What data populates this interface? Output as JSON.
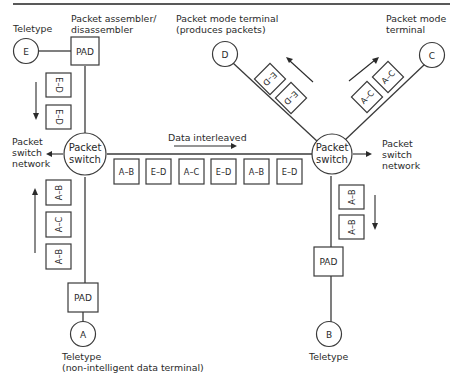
{
  "diagram": {
    "colors": {
      "line": "#3a3a3a",
      "text": "#2a2a2a",
      "background": "#ffffff"
    },
    "labels": {
      "teletype_e": "Teletype",
      "pad_top_line1": "Packet assembler/",
      "pad_top_line2": "disassembler",
      "terminal_d_line1": "Packet mode terminal",
      "terminal_d_line2": "(produces packets)",
      "terminal_c_line1": "Packet mode",
      "terminal_c_line2": "terminal",
      "network_left_line1": "Packet",
      "network_left_line2": "switch",
      "network_left_line3": "network",
      "network_right_line1": "Packet",
      "network_right_line2": "switch",
      "network_right_line3": "network",
      "data_interleaved": "Data interleaved",
      "teletype_a_line1": "Teletype",
      "teletype_a_line2": "(non-intelligent data terminal)",
      "teletype_b": "Teletype"
    },
    "nodes": {
      "terminal_e": "E",
      "terminal_d": "D",
      "terminal_c": "C",
      "terminal_a": "A",
      "terminal_b": "B",
      "pad_top": "PAD",
      "pad_left_bottom": "PAD",
      "pad_right_bottom": "PAD",
      "switch_left_line1": "Packet",
      "switch_left_line2": "switch",
      "switch_right_line1": "Packet",
      "switch_right_line2": "switch"
    },
    "packets": {
      "e_to_switch": [
        "E–D",
        "E–D"
      ],
      "a_to_switch": [
        "A–B",
        "A–C",
        "A–B"
      ],
      "interleaved": [
        "A–B",
        "E–D",
        "A–C",
        "E–D",
        "A–B",
        "E–D"
      ],
      "switch_to_d": [
        "E–D",
        "E–D"
      ],
      "switch_to_c": [
        "A–C",
        "A–C"
      ],
      "switch_to_b": [
        "A–B",
        "A–B"
      ]
    }
  }
}
